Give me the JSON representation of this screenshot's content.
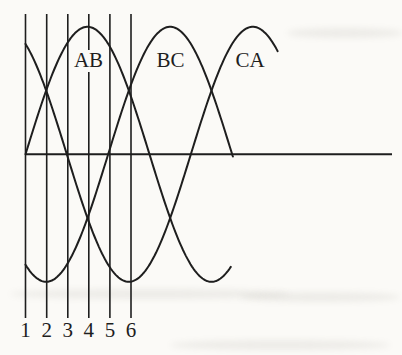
{
  "colors": {
    "ink": "#1e1e1e",
    "paper": "#fbfaf7"
  },
  "chart_data": {
    "type": "line",
    "title": "",
    "xlabel": "",
    "ylabel": "",
    "grid": "vertical-guide-lines-at-ticks",
    "legend": "inline-curve-labels",
    "equation": "y = sin(theta + phase_deg)",
    "y_range": [
      -1,
      1
    ],
    "series": [
      {
        "name": "ab",
        "label": "AB",
        "amplitude": 1,
        "phase_deg": 0,
        "start_deg": 0,
        "end_deg": 298
      },
      {
        "name": "bc",
        "label": "BC",
        "amplitude": 1,
        "phase_deg": -120,
        "start_deg": 0,
        "end_deg": 301
      },
      {
        "name": "ca",
        "label": "CA",
        "amplitude": 1,
        "phase_deg": -240,
        "start_deg": 0,
        "end_deg": 366
      }
    ],
    "x_ticks": [
      {
        "label": "1",
        "deg": 0
      },
      {
        "label": "2",
        "deg": 30
      },
      {
        "label": "3",
        "deg": 60
      },
      {
        "label": "4",
        "deg": 90
      },
      {
        "label": "5",
        "deg": 120
      },
      {
        "label": "6",
        "deg": 150
      }
    ],
    "key_points": {
      "peaks_deg": {
        "AB": 90,
        "BC": 210,
        "CA": 330
      },
      "troughs_deg": {
        "AB": 270,
        "BC": 30,
        "CA": 150
      },
      "upper_crossings_deg": [
        30,
        150,
        270
      ],
      "lower_crossings_deg": [
        90,
        210
      ]
    },
    "layout": {
      "width": 402,
      "height": 355,
      "x_origin_px": 25.5,
      "period_px": 248,
      "amplitude_px": 127.5,
      "baseline_y": 154.3,
      "axis_x_end_px": 392,
      "guide_x": [
        25.5,
        46.7,
        67.8,
        88.8,
        109.9,
        131
      ],
      "guide_top_y": 14,
      "guide_bottom_y": 318,
      "tick_label_y": 337,
      "curve_label_y": 67,
      "curve_label_x": [
        88.5,
        170.5,
        250
      ]
    }
  }
}
